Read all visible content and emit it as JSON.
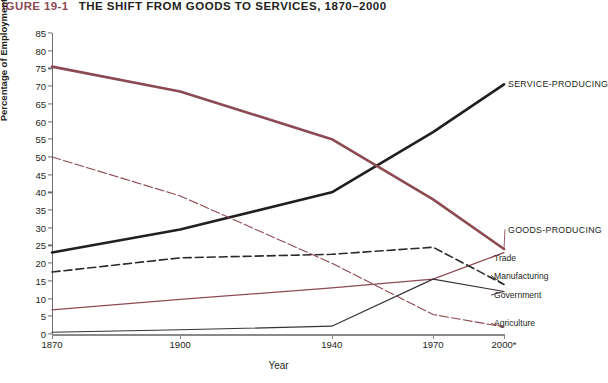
{
  "header": {
    "figure_number": "IGURE 19-1",
    "title": "THE SHIFT FROM GOODS TO SERVICES, 1870–2000"
  },
  "axes": {
    "y_title": "Percentage of Employment",
    "x_title": "Year",
    "y_ticks": [
      "85",
      "80",
      "75",
      "70",
      "65",
      "60",
      "55",
      "50",
      "45",
      "40",
      "35",
      "30",
      "25",
      "20",
      "15",
      "10",
      "5",
      "0"
    ],
    "x_ticks": [
      "1870",
      "1900",
      "1940",
      "1970",
      "2000*"
    ]
  },
  "colors": {
    "goods": "#8c4a52",
    "service": "#231f20",
    "trade": "#8c4a52",
    "manufacturing": "#2b2b2b",
    "government": "#3a3238",
    "agriculture": "#8c4a52",
    "axis": "#8a8a8a",
    "figure_number": "#8c4a52"
  },
  "chart_data": {
    "type": "line",
    "title": "THE SHIFT FROM GOODS TO SERVICES, 1870–2000",
    "xlabel": "Year",
    "ylabel": "Percentage of Employment",
    "x": [
      1870,
      1900,
      1940,
      1970,
      2000
    ],
    "xlim": [
      1870,
      2000
    ],
    "ylim": [
      0,
      85
    ],
    "ytick_step": 5,
    "grid": false,
    "legend_position": "right-inline-labels",
    "series": [
      {
        "name": "SERVICE-PRODUCING",
        "values": [
          23,
          29.5,
          40,
          57,
          70.5
        ],
        "style": "solid-thick",
        "color": "#231f20",
        "label_y": 70.5
      },
      {
        "name": "GOODS-PRODUCING",
        "values": [
          75.5,
          68.5,
          55,
          38,
          24
        ],
        "style": "solid-thick",
        "color": "#8c4a52",
        "label_y": 29.5
      },
      {
        "name": "Trade",
        "values": [
          6.8,
          9.8,
          13,
          15.5,
          23
        ],
        "style": "solid-thin",
        "color": "#8c4a52",
        "label_y": 21.5
      },
      {
        "name": "Manufacturing",
        "values": [
          17.5,
          21.5,
          22.5,
          24.5,
          14
        ],
        "style": "dashed",
        "color": "#2b2b2b",
        "label_y": 16.5
      },
      {
        "name": "Government",
        "values": [
          0.5,
          1.2,
          2.2,
          15.5,
          12
        ],
        "style": "solid-thin",
        "color": "#3a3238",
        "label_y": 11
      },
      {
        "name": "Agriculture",
        "values": [
          50,
          39,
          20,
          5.5,
          2
        ],
        "style": "dash-dot-thin",
        "color": "#8c4a52",
        "label_y": 3
      }
    ]
  }
}
